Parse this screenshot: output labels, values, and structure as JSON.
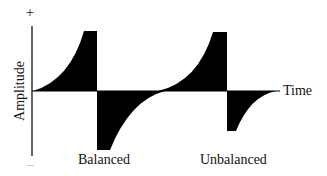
{
  "diagram": {
    "y_axis": {
      "label": "Amplitude",
      "top_symbol": "+",
      "bottom_symbol": "–"
    },
    "x_axis": {
      "label": "Time"
    },
    "pulses": [
      {
        "name": "Balanced",
        "label": "Balanced",
        "peak_positive": 1.0,
        "peak_negative": -1.0
      },
      {
        "name": "Unbalanced",
        "label": "Unbalanced",
        "peak_positive": 1.0,
        "peak_negative": -0.67
      }
    ],
    "colors": {
      "fill": "#000000",
      "axis": "#000000",
      "text": "#111111"
    }
  }
}
